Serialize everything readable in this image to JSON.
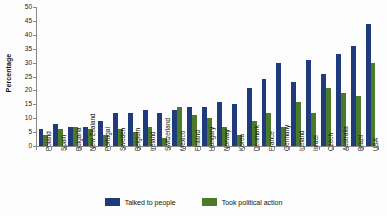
{
  "chart_data": {
    "type": "bar",
    "title": "",
    "xlabel": "",
    "ylabel": "Percentage",
    "ylim": [
      0,
      50
    ],
    "ytick_step": 5,
    "yticks": [
      0,
      5,
      10,
      15,
      20,
      25,
      30,
      35,
      40,
      45,
      50
    ],
    "grid": false,
    "legend_position": "bottom-center",
    "categories": [
      "Poland",
      "Spain",
      "Bulgaria",
      "New Zealand",
      "Portugal",
      "Sweden",
      "Belgium",
      "Ireland",
      "Switzerland",
      "Mexico",
      "Finland",
      "Hungary",
      "Norway",
      "Korea",
      "Denmark",
      "France",
      "Germany",
      "Iceland",
      "Israel",
      "Czech",
      "Australia",
      "Brazil",
      "USA"
    ],
    "series": [
      {
        "name": "Talked to people",
        "color": "#1F3B7B",
        "values": [
          6,
          8,
          7,
          7,
          9,
          12,
          12,
          13,
          12,
          13,
          14,
          14,
          16,
          15,
          21,
          24,
          30,
          23,
          31,
          26,
          33,
          36,
          44
        ]
      },
      {
        "name": "Took political action",
        "color": "#4B7A2B",
        "values": [
          4,
          6,
          7,
          6,
          4,
          6,
          5,
          7,
          3,
          14,
          11,
          10,
          7,
          4,
          9,
          12,
          7,
          16,
          12,
          21,
          19,
          18,
          30
        ]
      }
    ]
  },
  "legend": {
    "items": [
      {
        "label": "Talked to people",
        "color": "#1F3B7B"
      },
      {
        "label": "Took political action",
        "color": "#4B7A2B"
      }
    ]
  },
  "axis": {
    "y_title": "Percentage"
  }
}
